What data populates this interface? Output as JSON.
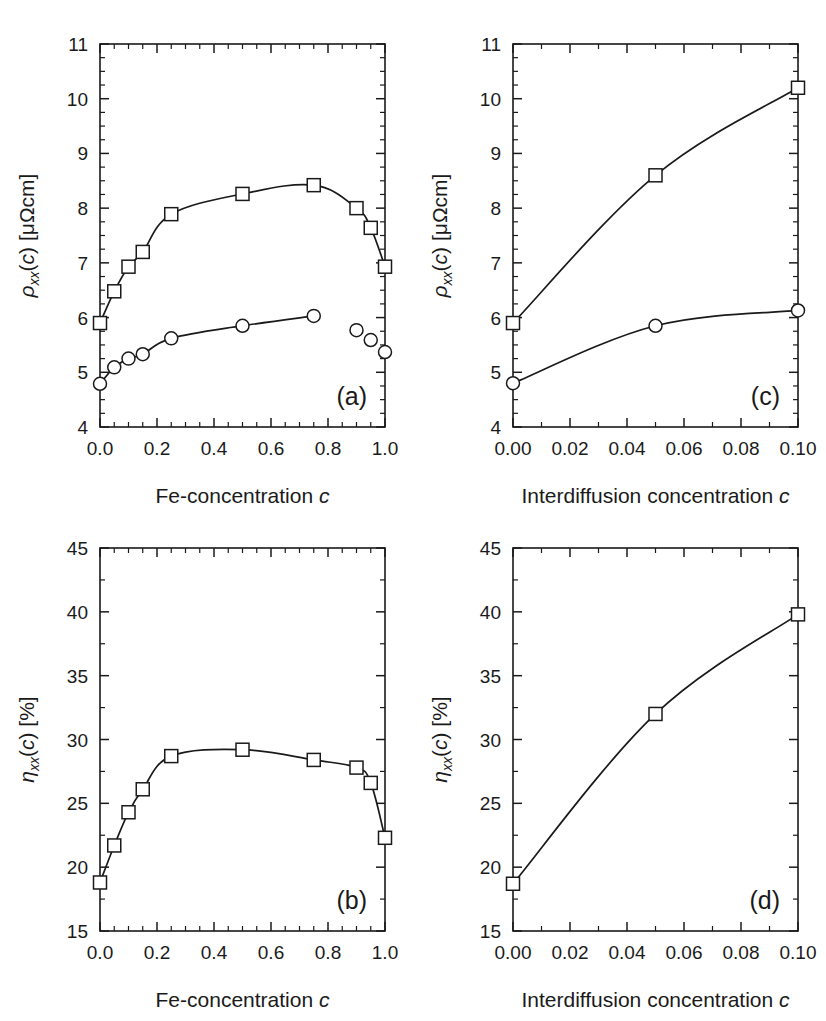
{
  "figure": {
    "background": "#ffffff",
    "ink_color": "#1a1a1a",
    "panel_count": 4
  },
  "chart_data": [
    {
      "id": "panel-a",
      "type": "line",
      "panel_label": "(a)",
      "title": "",
      "xlabel": "Fe-concentration c",
      "ylabel": "ρxx(c)  [μΩcm]",
      "ylabel_parts": {
        "symbol": "ρ",
        "subscript": "xx",
        "arg": "(c)",
        "unit": "[μΩcm]"
      },
      "xlim": [
        0.0,
        1.0
      ],
      "ylim": [
        4,
        11
      ],
      "xticks": [
        0.0,
        0.2,
        0.4,
        0.6,
        0.8,
        1.0
      ],
      "xtick_labels": [
        "0.0",
        "0.2",
        "0.4",
        "0.6",
        "0.8",
        "1.0"
      ],
      "xminor_step": 0.05,
      "yticks": [
        4,
        5,
        6,
        7,
        8,
        9,
        10,
        11
      ],
      "ytick_labels": [
        "4",
        "5",
        "6",
        "7",
        "8",
        "9",
        "10",
        "11"
      ],
      "yminor_step": 0.25,
      "grid": false,
      "legend": "none",
      "series": [
        {
          "name": "squares",
          "marker": "square",
          "connected": true,
          "x": [
            0.0,
            0.05,
            0.1,
            0.15,
            0.25,
            0.5,
            0.75,
            0.9,
            0.95,
            1.0
          ],
          "y": [
            5.9,
            6.48,
            6.93,
            7.2,
            7.89,
            8.26,
            8.42,
            8.0,
            7.64,
            6.93
          ]
        },
        {
          "name": "circles",
          "marker": "circle",
          "connected": true,
          "connected_through_index": 6,
          "x": [
            0.0,
            0.05,
            0.1,
            0.15,
            0.25,
            0.5,
            0.75,
            0.9,
            0.95,
            1.0
          ],
          "y": [
            4.79,
            5.09,
            5.25,
            5.33,
            5.62,
            5.85,
            6.03,
            5.77,
            5.59,
            5.37
          ]
        }
      ]
    },
    {
      "id": "panel-c",
      "type": "line",
      "panel_label": "(c)",
      "title": "",
      "xlabel": "Interdiffusion concentration c",
      "ylabel": "ρxx(c)  [μΩcm]",
      "ylabel_parts": {
        "symbol": "ρ",
        "subscript": "xx",
        "arg": "(c)",
        "unit": "[μΩcm]"
      },
      "xlim": [
        0.0,
        0.1
      ],
      "ylim": [
        4,
        11
      ],
      "xticks": [
        0.0,
        0.02,
        0.04,
        0.06,
        0.08,
        0.1
      ],
      "xtick_labels": [
        "0.00",
        "0.02",
        "0.04",
        "0.06",
        "0.08",
        "0.10"
      ],
      "xminor_step": 0.01,
      "yticks": [
        4,
        5,
        6,
        7,
        8,
        9,
        10,
        11
      ],
      "ytick_labels": [
        "4",
        "5",
        "6",
        "7",
        "8",
        "9",
        "10",
        "11"
      ],
      "yminor_step": 0.25,
      "grid": false,
      "legend": "none",
      "series": [
        {
          "name": "squares",
          "marker": "square",
          "connected": true,
          "x": [
            0.0,
            0.05,
            0.1
          ],
          "y": [
            5.9,
            8.6,
            10.2
          ]
        },
        {
          "name": "circles",
          "marker": "circle",
          "connected": true,
          "x": [
            0.0,
            0.05,
            0.1
          ],
          "y": [
            4.8,
            5.85,
            6.13
          ]
        }
      ]
    },
    {
      "id": "panel-b",
      "type": "line",
      "panel_label": "(b)",
      "title": "",
      "xlabel": "Fe-concentration c",
      "ylabel": "ηxx(c)  [%]",
      "ylabel_parts": {
        "symbol": "η",
        "subscript": "xx",
        "arg": "(c)",
        "unit": "[%]"
      },
      "xlim": [
        0.0,
        1.0
      ],
      "ylim": [
        15,
        45
      ],
      "xticks": [
        0.0,
        0.2,
        0.4,
        0.6,
        0.8,
        1.0
      ],
      "xtick_labels": [
        "0.0",
        "0.2",
        "0.4",
        "0.6",
        "0.8",
        "1.0"
      ],
      "xminor_step": 0.05,
      "yticks": [
        15,
        20,
        25,
        30,
        35,
        40,
        45
      ],
      "ytick_labels": [
        "15",
        "20",
        "25",
        "30",
        "35",
        "40",
        "45"
      ],
      "yminor_step": 2.5,
      "grid": false,
      "legend": "none",
      "series": [
        {
          "name": "squares",
          "marker": "square",
          "connected": true,
          "x": [
            0.0,
            0.05,
            0.1,
            0.15,
            0.25,
            0.5,
            0.75,
            0.9,
            0.95,
            1.0
          ],
          "y": [
            18.8,
            21.7,
            24.3,
            26.1,
            28.7,
            29.2,
            28.4,
            27.8,
            26.6,
            22.3
          ]
        }
      ]
    },
    {
      "id": "panel-d",
      "type": "line",
      "panel_label": "(d)",
      "title": "",
      "xlabel": "Interdiffusion concentration c",
      "ylabel": "ηxx(c)  [%]",
      "ylabel_parts": {
        "symbol": "η",
        "subscript": "xx",
        "arg": "(c)",
        "unit": "[%]"
      },
      "xlim": [
        0.0,
        0.1
      ],
      "ylim": [
        15,
        45
      ],
      "xticks": [
        0.0,
        0.02,
        0.04,
        0.06,
        0.08,
        0.1
      ],
      "xtick_labels": [
        "0.00",
        "0.02",
        "0.04",
        "0.06",
        "0.08",
        "0.10"
      ],
      "xminor_step": 0.01,
      "yticks": [
        15,
        20,
        25,
        30,
        35,
        40,
        45
      ],
      "ytick_labels": [
        "15",
        "20",
        "25",
        "30",
        "35",
        "40",
        "45"
      ],
      "yminor_step": 2.5,
      "grid": false,
      "legend": "none",
      "series": [
        {
          "name": "squares",
          "marker": "square",
          "connected": true,
          "x": [
            0.0,
            0.05,
            0.1
          ],
          "y": [
            18.7,
            32.0,
            39.8
          ]
        }
      ]
    }
  ]
}
